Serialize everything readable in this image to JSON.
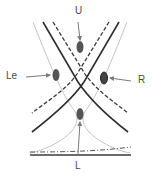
{
  "diagram": {
    "type": "crossing-curves-with-markers",
    "background": "#ffffff",
    "colors": {
      "dark_line": "#2e2e2e",
      "dashed_line": "#3a3a3a",
      "light_line": "#c4c4c4",
      "marker_fill": "#555555",
      "marker_outline": "#222222",
      "arrow": "#7a7a7a",
      "label": "#4a4a4a",
      "baseline": "#3a3a3a"
    },
    "labels": {
      "top": "U",
      "left": "Le",
      "right": "R",
      "bottom": "L"
    },
    "markers": [
      {
        "id": "U",
        "cx": 80,
        "cy": 47
      },
      {
        "id": "Le",
        "cx": 56,
        "cy": 75
      },
      {
        "id": "R",
        "cx": 104,
        "cy": 78
      },
      {
        "id": "L",
        "cx": 80,
        "cy": 114
      }
    ],
    "line_styles": [
      "solid-dark",
      "dashed-dark",
      "solid-light",
      "dash-dot-baseline"
    ]
  }
}
